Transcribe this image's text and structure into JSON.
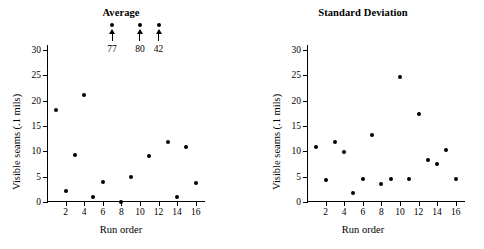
{
  "figure": {
    "panels": [
      "average",
      "standard-deviation"
    ]
  },
  "chart_data": [
    {
      "type": "scatter",
      "title": "Average",
      "xlabel": "Run order",
      "ylabel": "Visible seams (.1 mils)",
      "xlim": [
        0,
        17
      ],
      "ylim": [
        0,
        31
      ],
      "xticks": [
        2,
        4,
        6,
        8,
        10,
        12,
        14,
        16
      ],
      "yticks": [
        0,
        5,
        10,
        15,
        20,
        25,
        30
      ],
      "grid": false,
      "legend": null,
      "x": [
        1,
        2,
        3,
        4,
        5,
        6,
        7,
        8,
        9,
        10,
        11,
        12,
        13,
        14,
        15,
        16
      ],
      "values": [
        18.2,
        2.2,
        9.2,
        21.2,
        1.0,
        4.0,
        77,
        0.0,
        5.0,
        80,
        9.0,
        42,
        11.8,
        1.0,
        10.9,
        3.8
      ],
      "offscale_points": [
        {
          "x": 7,
          "value": 77,
          "label": "77"
        },
        {
          "x": 10,
          "value": 80,
          "label": "80"
        },
        {
          "x": 12,
          "value": 42,
          "label": "42"
        }
      ]
    },
    {
      "type": "scatter",
      "title": "Standard Deviation",
      "xlabel": "Run order",
      "ylabel": "Visible seams (.1 mils)",
      "xlim": [
        0,
        17
      ],
      "ylim": [
        0,
        31
      ],
      "xticks": [
        2,
        4,
        6,
        8,
        10,
        12,
        14,
        16
      ],
      "yticks": [
        0,
        5,
        10,
        15,
        20,
        25,
        30
      ],
      "grid": false,
      "legend": null,
      "x": [
        1,
        2,
        3,
        4,
        5,
        6,
        7,
        8,
        9,
        10,
        11,
        12,
        13,
        14,
        15,
        16
      ],
      "values": [
        10.8,
        4.3,
        11.8,
        9.8,
        1.8,
        4.6,
        13.3,
        3.6,
        4.6,
        24.6,
        4.6,
        17.4,
        8.3,
        7.6,
        10.3,
        4.5
      ],
      "offscale_points": []
    }
  ],
  "colors": {
    "marker": "#000000",
    "axis": "#000000",
    "background": "#ffffff"
  }
}
